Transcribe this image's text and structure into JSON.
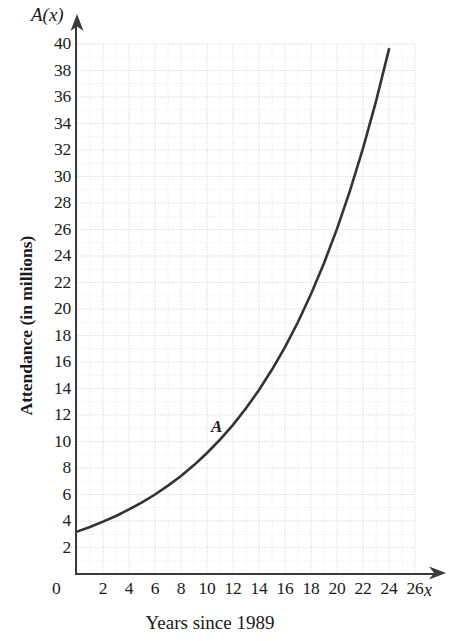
{
  "figure": {
    "function_name": "A(x)",
    "x_variable_label": "x",
    "curve_label": "A",
    "x_axis_title": "Years since 1989",
    "y_axis_title": "Attendance (in millions)",
    "origin_label": "0",
    "line_color": "#333333",
    "grid_color": "#c9c9c9",
    "axis_color": "#3a3a3a"
  },
  "chart_data": {
    "type": "line",
    "title": "",
    "subtitle": "",
    "xlabel": "Years since 1989",
    "ylabel": "Attendance (in millions)",
    "function_notation": "A(x)",
    "series_name": "A",
    "xlim": [
      0,
      26
    ],
    "ylim": [
      0,
      40
    ],
    "xticks": [
      2,
      4,
      6,
      8,
      10,
      12,
      14,
      16,
      18,
      20,
      22,
      24,
      26
    ],
    "yticks": [
      2,
      4,
      6,
      8,
      10,
      12,
      14,
      16,
      18,
      20,
      22,
      24,
      26,
      28,
      30,
      32,
      34,
      36,
      38,
      40
    ],
    "xtick_labels": [
      "2",
      "4",
      "6",
      "8",
      "10",
      "12",
      "14",
      "16",
      "18",
      "20",
      "22",
      "24",
      "26"
    ],
    "ytick_labels": [
      "2",
      "4",
      "6",
      "8",
      "10",
      "12",
      "14",
      "16",
      "18",
      "20",
      "22",
      "24",
      "26",
      "28",
      "30",
      "32",
      "34",
      "36",
      "38",
      "40"
    ],
    "grid": true,
    "grid_style": "dotted",
    "grid_minor_step_x": 1,
    "grid_minor_step_y": 1,
    "legend": false,
    "model": "A(x) = 3.2 * 1.1105^x",
    "x": [
      0,
      1,
      2,
      3,
      4,
      5,
      6,
      7,
      8,
      9,
      10,
      11,
      12,
      13,
      14,
      15,
      16,
      17,
      18,
      19,
      20,
      21,
      22,
      23,
      24
    ],
    "values": [
      3.2,
      3.55,
      3.95,
      4.38,
      4.87,
      5.41,
      6.0,
      6.67,
      7.4,
      8.22,
      9.13,
      10.14,
      11.26,
      12.51,
      13.89,
      15.43,
      17.13,
      19.02,
      21.13,
      23.46,
      26.05,
      28.93,
      32.12,
      35.67,
      39.61
    ],
    "annotations": [
      {
        "text": "A",
        "x": 12.3,
        "y": 11.3,
        "style": "italic-bold"
      }
    ]
  }
}
